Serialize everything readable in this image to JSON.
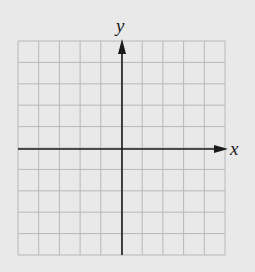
{
  "figure": {
    "type": "coordinate-plane",
    "x_axis_label": "x",
    "y_axis_label": "y",
    "grid": {
      "columns": 10,
      "rows": 10,
      "left": 18,
      "top": 41,
      "right": 225,
      "bottom": 255,
      "line_color": "#b8b8b8"
    },
    "origin": {
      "x": 122,
      "y": 149
    },
    "axis_color": "#1a1a1a",
    "background_color": "#e9e9e9"
  }
}
